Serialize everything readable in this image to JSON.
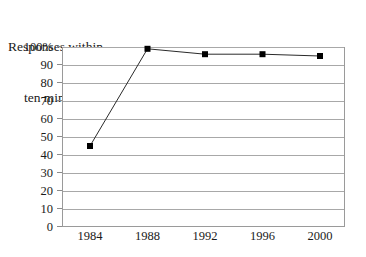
{
  "chart_data": {
    "type": "line",
    "title": "Responses within ten minutes",
    "title_lines": [
      "Responses within",
      "ten minutes"
    ],
    "xlabel": "",
    "ylabel": "",
    "categories": [
      "1984",
      "1988",
      "1992",
      "1996",
      "2000"
    ],
    "x": [
      1984,
      1988,
      1992,
      1996,
      2000
    ],
    "values": [
      45,
      99,
      96,
      96,
      95
    ],
    "series": [
      {
        "name": "Responses within ten minutes",
        "values": [
          45,
          99,
          96,
          96,
          95
        ]
      }
    ],
    "ylim": [
      0,
      100
    ],
    "xlim": [
      1982,
      2002
    ],
    "y_ticks": [
      0,
      10,
      20,
      30,
      40,
      50,
      60,
      70,
      80,
      90,
      100
    ],
    "y_tick_labels": [
      "0",
      "10",
      "20",
      "30",
      "40",
      "50",
      "60",
      "70",
      "80",
      "90",
      "100%"
    ],
    "x_tick_labels": [
      "1984",
      "1988",
      "1992",
      "1996",
      "2000"
    ],
    "grid": true,
    "grid_axis": "y",
    "legend": false,
    "legend_position": "none",
    "marker": "square",
    "marker_color": "#000000",
    "line_color": "#2a2a2a",
    "grid_color": "#a8a8a8",
    "border_color": "#9a9a9a",
    "background_color": "#ffffff",
    "text_color": "#1a1a1a"
  }
}
